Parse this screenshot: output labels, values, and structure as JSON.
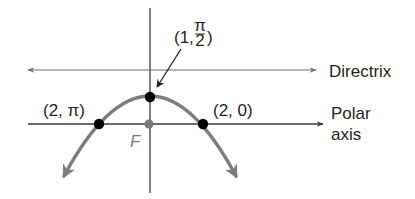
{
  "diagram": {
    "type": "polar-conic-parabola",
    "labels": {
      "vertex": "(1, π/2)",
      "vertex_prefix": "(1,",
      "vertex_num": "π",
      "vertex_den": "2",
      "vertex_suffix": ")",
      "left_point": "(2, π)",
      "right_point": "(2, 0)",
      "focus": "F",
      "directrix": "Directrix",
      "polar_axis_line1": "Polar",
      "polar_axis_line2": "axis"
    },
    "points": [
      {
        "name": "vertex",
        "polar": "(1, π/2)",
        "fill": "#000000"
      },
      {
        "name": "left",
        "polar": "(2, π)",
        "fill": "#000000"
      },
      {
        "name": "right",
        "polar": "(2, 0)",
        "fill": "#000000"
      },
      {
        "name": "focus",
        "label": "F",
        "fill": "#7a7a7a"
      }
    ],
    "colors": {
      "curve": "#7d7d7d",
      "axis": "#3a3a3a",
      "directrix": "#6e6e6e",
      "point": "#000000",
      "focus": "#7a7a7a",
      "text": "#231f20"
    }
  }
}
